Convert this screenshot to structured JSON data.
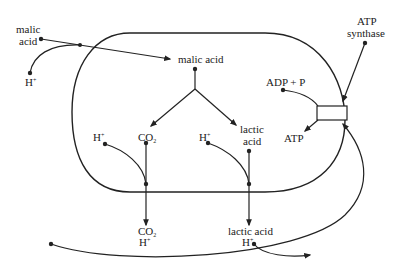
{
  "diagram": {
    "type": "cell-transport-schematic",
    "labels": {
      "malic_acid_outside_l1": "malic",
      "malic_acid_outside_l2": "acid",
      "h_plus_outside_left": "H",
      "h_plus_sup": "+",
      "malic_acid_inside": "malic acid",
      "co2_inside": "CO",
      "co2_sub": "2",
      "h_plus_inside_left": "H",
      "h_plus_inside_right": "H",
      "lactic_acid_inside_l1": "lactic",
      "lactic_acid_inside_l2": "acid",
      "adp_p": "ADP + P",
      "atp": "ATP",
      "atp_synthase_l1": "ATP",
      "atp_synthase_l2": "synthase",
      "co2_outside": "CO",
      "h_plus_outside_bottom_left": "H",
      "lactic_acid_outside": "lactic acid",
      "h_plus_outside_bottom_right": "H"
    },
    "colors": {
      "stroke": "#222222",
      "background": "#ffffff"
    }
  }
}
